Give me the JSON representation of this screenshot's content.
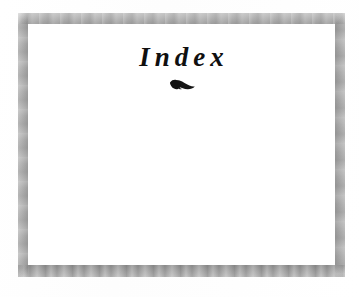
{
  "page": {
    "kind": "book-section-divider-page",
    "background_color": "#ffffff",
    "paper_color": "#fefefe"
  },
  "frame": {
    "name": "decorative-border",
    "color": "#a8a8a8",
    "top_color": "#ababab",
    "right_color": "#a6a6a6",
    "bottom_color": "#a2a2a2",
    "left_color": "#a9a9a9",
    "inner_fill": "#ffffff"
  },
  "content": {
    "title": "Index",
    "title_color": "#101010",
    "ornament_label": "leaf-fleuron",
    "ornament_color": "#151515",
    "body_text": ""
  }
}
